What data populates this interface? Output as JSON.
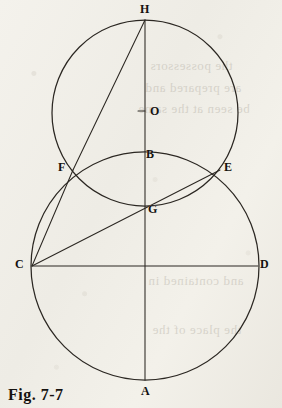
{
  "figure": {
    "caption": "Fig. 7-7",
    "background_color": "#f2f0ea",
    "ink_color": "#2b2722",
    "canvas": {
      "width": 282,
      "height": 408
    }
  },
  "points": [
    {
      "id": "H",
      "label": "H",
      "x": 145,
      "y": 20,
      "label_x": 140,
      "label_y": 3,
      "role": "top-of-upper-circle"
    },
    {
      "id": "O",
      "label": "O",
      "x": 145,
      "y": 113,
      "label_x": 150,
      "label_y": 105,
      "role": "center-of-upper-circle"
    },
    {
      "id": "B",
      "label": "B",
      "x": 145,
      "y": 152,
      "label_x": 146,
      "label_y": 148,
      "role": "top-of-large-circle"
    },
    {
      "id": "F",
      "label": "F",
      "x": 73,
      "y": 170,
      "label_x": 58,
      "label_y": 161,
      "role": "circle-intersection-left"
    },
    {
      "id": "E",
      "label": "E",
      "x": 220,
      "y": 170,
      "label_x": 224,
      "label_y": 161,
      "role": "circle-intersection-right"
    },
    {
      "id": "G",
      "label": "G",
      "x": 145,
      "y": 206,
      "label_x": 148,
      "label_y": 203,
      "role": "bottom-of-upper-circle"
    },
    {
      "id": "C",
      "label": "C",
      "x": 32,
      "y": 266,
      "label_x": 15,
      "label_y": 258,
      "role": "left-of-large-circle"
    },
    {
      "id": "D",
      "label": "D",
      "x": 258,
      "y": 266,
      "label_x": 260,
      "label_y": 258,
      "role": "right-of-large-circle"
    },
    {
      "id": "A",
      "label": "A",
      "x": 145,
      "y": 380,
      "label_x": 141,
      "label_y": 385,
      "role": "bottom-of-large-circle"
    }
  ],
  "circles": [
    {
      "id": "upper-circle",
      "cx": 145,
      "cy": 113,
      "r": 93,
      "through": [
        "H",
        "F",
        "E",
        "G"
      ]
    },
    {
      "id": "large-circle",
      "cx": 145,
      "cy": 266,
      "r": 114,
      "through": [
        "B",
        "F",
        "E",
        "C",
        "D",
        "A"
      ]
    }
  ],
  "segments": [
    {
      "id": "vertical-diameter",
      "from": "H",
      "to": "A",
      "x1": 145,
      "y1": 20,
      "x2": 145,
      "y2": 380
    },
    {
      "id": "horizontal-diameter",
      "from": "C",
      "to": "D",
      "x1": 32,
      "y1": 266,
      "x2": 258,
      "y2": 266
    },
    {
      "id": "chord-FH",
      "from": "F",
      "to": "H",
      "x1": 73,
      "y1": 170,
      "x2": 145,
      "y2": 20
    },
    {
      "id": "chord-CF",
      "from": "C",
      "to": "F",
      "x1": 32,
      "y1": 266,
      "x2": 73,
      "y2": 170
    },
    {
      "id": "chord-CE",
      "from": "C",
      "to": "E",
      "x1": 32,
      "y1": 266,
      "x2": 220,
      "y2": 170
    }
  ],
  "center_tick": {
    "id": "center-tick-O",
    "x1": 138,
    "y1": 111,
    "x2": 145,
    "y2": 111
  },
  "ghost_text": [
    {
      "text": "the possessors",
      "x": 150,
      "y": 58,
      "size": 13
    },
    {
      "text": "are prepared and",
      "x": 145,
      "y": 80,
      "size": 13
    },
    {
      "text": "be seen at the same",
      "x": 138,
      "y": 101,
      "size": 13
    },
    {
      "text": "and contained in",
      "x": 148,
      "y": 273,
      "size": 13
    },
    {
      "text": "the place of the",
      "x": 152,
      "y": 322,
      "size": 13
    }
  ]
}
